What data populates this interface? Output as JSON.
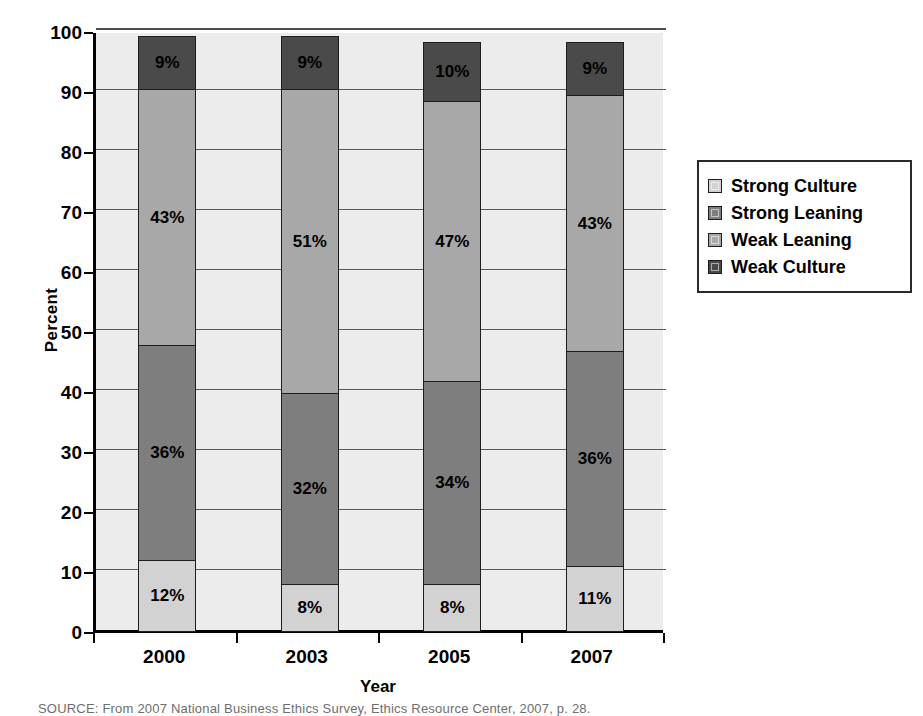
{
  "chart_data": {
    "type": "bar",
    "subtype": "stacked-100-percent-column",
    "title": "",
    "xlabel": "Year",
    "ylabel": "Percent",
    "ylim": [
      0,
      100
    ],
    "ytick_step": 10,
    "yticks": [
      100,
      90,
      80,
      70,
      60,
      50,
      40,
      30,
      20,
      10,
      0
    ],
    "grid": true,
    "legend_position": "right",
    "categories": [
      "2000",
      "2003",
      "2005",
      "2007"
    ],
    "series": [
      {
        "name": "Weak Culture",
        "color": "#4a4a4a",
        "values": [
          9,
          9,
          10,
          9
        ],
        "labels": [
          "9%",
          "9%",
          "10%",
          "9%"
        ]
      },
      {
        "name": "Weak Leaning",
        "color": "#a8a8a8",
        "values": [
          43,
          51,
          47,
          43
        ],
        "labels": [
          "43%",
          "51%",
          "47%",
          "43%"
        ]
      },
      {
        "name": "Strong Leaning",
        "color": "#7e7e7e",
        "values": [
          36,
          32,
          34,
          36
        ],
        "labels": [
          "36%",
          "32%",
          "34%",
          "36%"
        ]
      },
      {
        "name": "Strong Culture",
        "color": "#d2d2d2",
        "values": [
          12,
          8,
          8,
          11
        ],
        "labels": [
          "12%",
          "8%",
          "8%",
          "11%"
        ]
      }
    ],
    "stack_order_bottom_to_top": [
      "Strong Culture",
      "Strong Leaning",
      "Weak Leaning",
      "Weak Culture"
    ],
    "bar_totals": [
      100,
      100,
      99,
      99
    ],
    "plot_background": "#ececec",
    "gridline_color": "#5a5a5a",
    "axis_color": "#000000"
  },
  "legend": {
    "items": [
      {
        "label": "Strong Culture",
        "color": "#d2d2d2"
      },
      {
        "label": "Strong Leaning",
        "color": "#7e7e7e"
      },
      {
        "label": "Weak Leaning",
        "color": "#a8a8a8"
      },
      {
        "label": "Weak Culture",
        "color": "#4a4a4a"
      }
    ]
  },
  "axes": {
    "y_title": "Percent",
    "x_title": "Year",
    "y_ticks": [
      "100",
      "90",
      "80",
      "70",
      "60",
      "50",
      "40",
      "30",
      "20",
      "10",
      "0"
    ],
    "x_ticks": [
      "2000",
      "2003",
      "2005",
      "2007"
    ]
  },
  "footnote": {
    "source": "SOURCE: From 2007 National Business Ethics Survey, Ethics Resource Center, 2007, p. 28."
  }
}
